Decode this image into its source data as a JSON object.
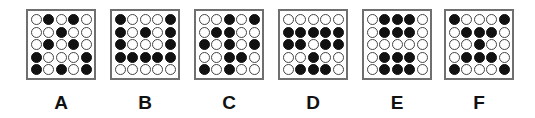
{
  "options": [
    {
      "label": "A",
      "left": 26,
      "grid": [
        [
          0,
          1,
          0,
          1,
          0
        ],
        [
          0,
          0,
          1,
          0,
          0
        ],
        [
          0,
          1,
          0,
          1,
          0
        ],
        [
          1,
          0,
          0,
          0,
          1
        ],
        [
          1,
          0,
          1,
          0,
          1
        ]
      ]
    },
    {
      "label": "B",
      "left": 110,
      "grid": [
        [
          1,
          0,
          0,
          0,
          1
        ],
        [
          1,
          0,
          1,
          0,
          1
        ],
        [
          1,
          0,
          0,
          0,
          1
        ],
        [
          1,
          1,
          1,
          1,
          1
        ],
        [
          0,
          0,
          0,
          0,
          0
        ]
      ]
    },
    {
      "label": "C",
      "left": 194,
      "grid": [
        [
          0,
          0,
          1,
          0,
          1
        ],
        [
          0,
          1,
          1,
          0,
          0
        ],
        [
          1,
          0,
          1,
          0,
          1
        ],
        [
          0,
          0,
          1,
          1,
          0
        ],
        [
          1,
          0,
          1,
          0,
          0
        ]
      ]
    },
    {
      "label": "D",
      "left": 278,
      "grid": [
        [
          0,
          0,
          0,
          0,
          0
        ],
        [
          1,
          1,
          1,
          1,
          1
        ],
        [
          1,
          1,
          0,
          1,
          1
        ],
        [
          0,
          0,
          1,
          0,
          0
        ],
        [
          0,
          1,
          1,
          1,
          0
        ]
      ]
    },
    {
      "label": "E",
      "left": 362,
      "grid": [
        [
          0,
          1,
          1,
          1,
          0
        ],
        [
          0,
          1,
          1,
          1,
          0
        ],
        [
          0,
          0,
          0,
          0,
          0
        ],
        [
          0,
          1,
          1,
          1,
          0
        ],
        [
          0,
          1,
          1,
          1,
          0
        ]
      ]
    },
    {
      "label": "F",
      "left": 444,
      "grid": [
        [
          1,
          0,
          0,
          0,
          1
        ],
        [
          0,
          1,
          1,
          1,
          0
        ],
        [
          0,
          0,
          1,
          0,
          0
        ],
        [
          0,
          1,
          1,
          1,
          0
        ],
        [
          1,
          0,
          0,
          0,
          1
        ]
      ]
    }
  ],
  "colors": {
    "filled": "#111111",
    "empty": "#ffffff",
    "border": "#6f6f6f"
  }
}
